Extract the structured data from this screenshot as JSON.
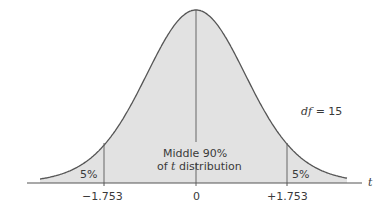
{
  "chart_data": {
    "type": "area",
    "title": "",
    "distribution": "t distribution",
    "df_label": "df",
    "df_eq": "= 15",
    "df": 15,
    "xlabel": "t",
    "ticks": [
      {
        "value": -1.753,
        "label": "−1.753"
      },
      {
        "value": 0,
        "label": "0"
      },
      {
        "value": 1.753,
        "label": "+1.753"
      }
    ],
    "regions": [
      {
        "name": "left tail",
        "from": null,
        "to": -1.753,
        "label": "5%"
      },
      {
        "name": "middle",
        "from": -1.753,
        "to": 1.753,
        "label_line1": "Middle 90%",
        "label_line2_pre": "of ",
        "label_line2_ital": "t",
        "label_line2_post": " distribution"
      },
      {
        "name": "right tail",
        "from": 1.753,
        "to": null,
        "label": "5%"
      }
    ],
    "fill_color": "#e2e2e2",
    "line_color": "#555555"
  }
}
